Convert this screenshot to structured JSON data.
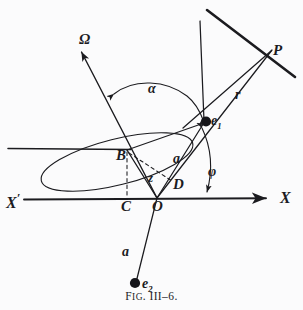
{
  "figure": {
    "caption_prefix": "F",
    "caption_smallcaps": "IG",
    "caption_rest": ". III–6.",
    "caption_full": "Fig. III–6.",
    "background_color": "#fbfbfc",
    "ink_color": "#1b1b1f",
    "width": 303,
    "height": 310
  },
  "labels": {
    "node_axis": "Ω",
    "angle_alpha": "α",
    "angle_phi": "φ",
    "point_P": "P",
    "radius_r": "r",
    "electron_1": "e",
    "electron_1_sub": "1",
    "electron_2": "e",
    "electron_2_sub": "2",
    "point_B": "B",
    "point_C": "C",
    "point_D": "D",
    "point_O": "O",
    "axis_x_left": "X",
    "axis_x_left_prime": "′",
    "axis_x_right": "X",
    "semi_axis_upper": "a",
    "semi_axis_lower": "a",
    "height_z": "z"
  },
  "geometry": {
    "points": {
      "O": [
        157,
        198
      ],
      "B": [
        127,
        150
      ],
      "C": [
        127,
        198
      ],
      "D": [
        172,
        180
      ],
      "e1": [
        206,
        122
      ],
      "e2": [
        137,
        283
      ],
      "P": [
        271,
        51
      ],
      "omega_tip": [
        78,
        48
      ],
      "x_axis_left": [
        24,
        199
      ],
      "x_axis_right": [
        269,
        198
      ],
      "horiz_left": [
        8,
        148
      ],
      "top_bar_start": [
        208,
        10
      ],
      "top_bar_end": [
        295,
        77
      ],
      "perp_upper_start": [
        200,
        21
      ],
      "perp_lower_start": [
        224,
        38
      ]
    },
    "ellipse": {
      "center": [
        117,
        162
      ],
      "rx": 78,
      "ry": 23,
      "rotation_deg": -14
    },
    "dashed_segments": [
      [
        "B",
        "C"
      ],
      [
        "B",
        "D"
      ]
    ],
    "solid_segments": [
      [
        "O",
        "B"
      ],
      [
        "O",
        "e1"
      ],
      [
        "O",
        "e2"
      ],
      [
        "B",
        "e1"
      ],
      [
        "O",
        "omega_tip"
      ],
      [
        "O",
        "P"
      ],
      [
        "e1",
        "top_bar"
      ],
      [
        "X_prime",
        "X"
      ]
    ]
  }
}
